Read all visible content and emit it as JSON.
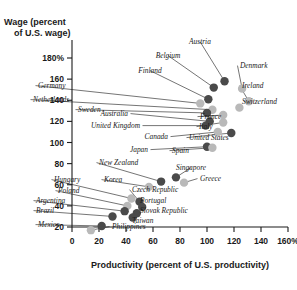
{
  "chart_data": {
    "type": "scatter",
    "title": "",
    "xlabel": "Productivity (percent of U.S. productivity)",
    "ylabel": "Wage (percent of U.S. wage)",
    "ylabel_line1": "Wage (percent",
    "ylabel_line2": "of U.S. wage)",
    "xlim": [
      0,
      160
    ],
    "ylim": [
      10,
      190
    ],
    "xticks": [
      "0",
      "20",
      "40",
      "60",
      "80",
      "100",
      "120",
      "140",
      "160%"
    ],
    "xtick_values": [
      0,
      20,
      40,
      60,
      80,
      100,
      120,
      140,
      160
    ],
    "ytick_values": [
      20,
      40,
      60,
      80,
      100,
      120,
      140,
      160,
      180
    ],
    "yticks": [
      "20",
      "40",
      "60",
      "80",
      "100",
      "120",
      "140",
      "160",
      "180%"
    ],
    "grid": false,
    "legend": "none",
    "marker_dark": "#4a4a4a",
    "marker_light": "#b9b9b9",
    "points": [
      {
        "name": "Austria",
        "x": 113,
        "y": 158,
        "shade": "dark",
        "lx": 200,
        "ly": 44,
        "anchor": "middle"
      },
      {
        "name": "Denmark",
        "x": 126,
        "y": 151,
        "shade": "light",
        "lx": 240,
        "ly": 68,
        "anchor": "start"
      },
      {
        "name": "Belgium",
        "x": 105,
        "y": 152,
        "shade": "dark",
        "lx": 168,
        "ly": 58,
        "anchor": "middle"
      },
      {
        "name": "Ireland",
        "x": 131,
        "y": 139,
        "shade": "light",
        "lx": 242,
        "ly": 88,
        "anchor": "start"
      },
      {
        "name": "Finland",
        "x": 101,
        "y": 141,
        "shade": "dark",
        "lx": 150,
        "ly": 73,
        "anchor": "middle"
      },
      {
        "name": "Germany",
        "x": 95,
        "y": 137,
        "shade": "light",
        "lx": 38,
        "ly": 88,
        "anchor": "start"
      },
      {
        "name": "Switzerland",
        "x": 124,
        "y": 133,
        "shade": "light",
        "lx": 242,
        "ly": 104,
        "anchor": "start"
      },
      {
        "name": "Netherlands",
        "x": 104,
        "y": 131,
        "shade": "light",
        "lx": 33,
        "ly": 102,
        "anchor": "start"
      },
      {
        "name": "Sweden",
        "x": 100,
        "y": 128,
        "shade": "dark",
        "lx": 78,
        "ly": 112,
        "anchor": "start"
      },
      {
        "name": "France",
        "x": 112,
        "y": 126,
        "shade": "light",
        "lx": 200,
        "ly": 119,
        "anchor": "start"
      },
      {
        "name": "Australia",
        "x": 102,
        "y": 120,
        "shade": "dark",
        "lx": 128,
        "ly": 116,
        "anchor": "end"
      },
      {
        "name": "Italy",
        "x": 112,
        "y": 119,
        "shade": "light",
        "lx": 199,
        "ly": 129,
        "anchor": "start"
      },
      {
        "name": "United Kingdom",
        "x": 99,
        "y": 116,
        "shade": "dark",
        "lx": 140,
        "ly": 128,
        "anchor": "end"
      },
      {
        "name": "Canada",
        "x": 108,
        "y": 110,
        "shade": "light",
        "lx": 168,
        "ly": 139,
        "anchor": "end"
      },
      {
        "name": "United States",
        "x": 118,
        "y": 109,
        "shade": "dark",
        "lx": 189,
        "ly": 140,
        "anchor": "start"
      },
      {
        "name": "Japan",
        "x": 100,
        "y": 96,
        "shade": "dark",
        "lx": 148,
        "ly": 152,
        "anchor": "end"
      },
      {
        "name": "Spain",
        "x": 104,
        "y": 95,
        "shade": "light",
        "lx": 172,
        "ly": 153,
        "anchor": "start"
      },
      {
        "name": "Singapore",
        "x": 77,
        "y": 67,
        "shade": "dark",
        "lx": 191,
        "ly": 170,
        "anchor": "middle"
      },
      {
        "name": "New Zealand",
        "x": 66,
        "y": 63,
        "shade": "dark",
        "lx": 99,
        "ly": 165,
        "anchor": "start"
      },
      {
        "name": "Greece",
        "x": 83,
        "y": 62,
        "shade": "light",
        "lx": 200,
        "ly": 181,
        "anchor": "start"
      },
      {
        "name": "Korea",
        "x": 57,
        "y": 58,
        "shade": "light",
        "lx": 104,
        "ly": 182,
        "anchor": "start"
      },
      {
        "name": "Hungary",
        "x": 44,
        "y": 47,
        "shade": "light",
        "lx": 54,
        "ly": 182,
        "anchor": "start"
      },
      {
        "name": "Czech Republic",
        "x": 50,
        "y": 44,
        "shade": "dark",
        "lx": 132,
        "ly": 192,
        "anchor": "start"
      },
      {
        "name": "Poland",
        "x": 41,
        "y": 40,
        "shade": "light",
        "lx": 58,
        "ly": 193,
        "anchor": "start"
      },
      {
        "name": "Portugal",
        "x": 52,
        "y": 39,
        "shade": "dark",
        "lx": 140,
        "ly": 203,
        "anchor": "start"
      },
      {
        "name": "Argentina",
        "x": 39,
        "y": 35,
        "shade": "dark",
        "lx": 36,
        "ly": 203,
        "anchor": "start"
      },
      {
        "name": "Slovak Republic",
        "x": 48,
        "y": 33,
        "shade": "dark",
        "lx": 140,
        "ly": 213,
        "anchor": "start"
      },
      {
        "name": "Brazil",
        "x": 30,
        "y": 30,
        "shade": "dark",
        "lx": 36,
        "ly": 213,
        "anchor": "start"
      },
      {
        "name": "Taiwan",
        "x": 45,
        "y": 29,
        "shade": "dark",
        "lx": 132,
        "ly": 223,
        "anchor": "start"
      },
      {
        "name": "Mexico",
        "x": 22,
        "y": 21,
        "shade": "dark",
        "lx": 38,
        "ly": 227,
        "anchor": "start"
      },
      {
        "name": "Philippines",
        "x": 14,
        "y": 17,
        "shade": "light",
        "lx": 112,
        "ly": 229,
        "anchor": "start"
      },
      {
        "name": "Taiwan2",
        "x": 46,
        "y": 31,
        "shade": "dark",
        "lx": 0,
        "ly": 0,
        "anchor": "none"
      }
    ]
  }
}
